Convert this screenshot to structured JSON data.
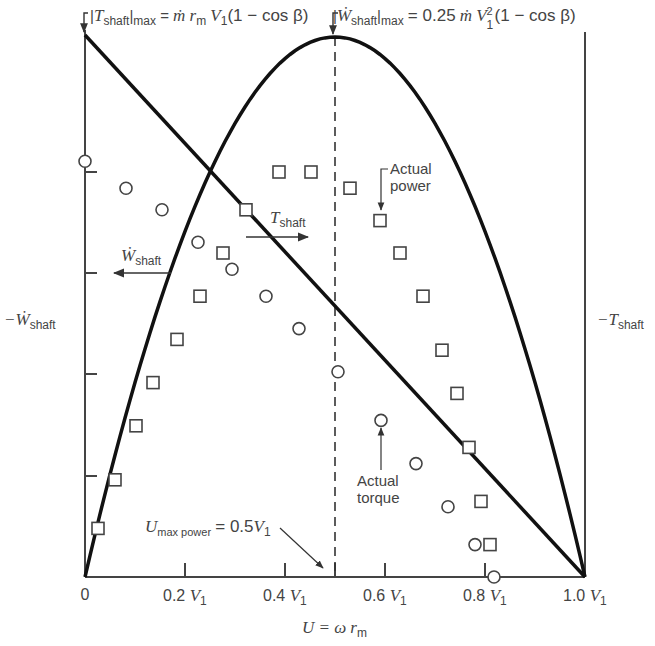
{
  "chart_data": {
    "type": "line",
    "title": "",
    "xlabel": "U = ω r_m",
    "ylabel_left": "−Ẇ_shaft",
    "ylabel_right": "−T_shaft",
    "xlim": [
      0,
      1.0
    ],
    "ylim": [
      0,
      1.0
    ],
    "x_ticks": [
      0,
      0.2,
      0.4,
      0.6,
      0.8,
      1.0
    ],
    "x_tick_labels": [
      "0",
      "0.2 V1",
      "0.4 V1",
      "0.6 V1",
      "0.8 V1",
      "1.0 V1"
    ],
    "y_ticks": [
      0.2,
      0.4,
      0.6,
      0.8
    ],
    "grid": false,
    "series": [
      {
        "name": "T_shaft (ideal torque)",
        "kind": "line",
        "x": [
          0,
          1.0
        ],
        "y": [
          1.0,
          0.0
        ]
      },
      {
        "name": "W_shaft (ideal power)",
        "kind": "curve",
        "equation": "y = 4x(1-x)",
        "x": [
          0,
          0.1,
          0.2,
          0.3,
          0.4,
          0.5,
          0.6,
          0.7,
          0.8,
          0.9,
          1.0
        ],
        "y": [
          0,
          0.36,
          0.64,
          0.84,
          0.96,
          1.0,
          0.96,
          0.84,
          0.64,
          0.36,
          0
        ]
      },
      {
        "name": "Actual power",
        "kind": "scatter",
        "marker": "square",
        "x": [
          0.026,
          0.06,
          0.102,
          0.136,
          0.184,
          0.23,
          0.276,
          0.322,
          0.388,
          0.452,
          0.53,
          0.59,
          0.63,
          0.676,
          0.714,
          0.744,
          0.768,
          0.792,
          0.81
        ],
        "y": [
          0.09,
          0.18,
          0.28,
          0.36,
          0.44,
          0.52,
          0.6,
          0.68,
          0.75,
          0.75,
          0.72,
          0.66,
          0.6,
          0.52,
          0.42,
          0.34,
          0.24,
          0.14,
          0.06
        ]
      },
      {
        "name": "Actual torque",
        "kind": "scatter",
        "marker": "circle",
        "x": [
          0.0,
          0.082,
          0.154,
          0.226,
          0.294,
          0.362,
          0.428,
          0.506,
          0.592,
          0.662,
          0.726,
          0.78,
          0.818
        ],
        "y": [
          0.77,
          0.72,
          0.68,
          0.62,
          0.57,
          0.52,
          0.46,
          0.38,
          0.29,
          0.21,
          0.13,
          0.06,
          0.0
        ]
      }
    ],
    "reference_lines": [
      {
        "type": "vertical",
        "x": 0.5,
        "style": "dashed",
        "label": "U_max power = 0.5 V1"
      }
    ],
    "annotations": [
      {
        "text": "|T_shaft|_max = ṁ r_m V1 (1 − cos β)",
        "points_to": [
          0,
          1.0
        ]
      },
      {
        "text": "|Ẇ_shaft|_max = 0.25 ṁ V1² (1 − cos β)",
        "points_to": [
          0.5,
          1.0
        ]
      },
      {
        "text": "U_max power = 0.5 V1",
        "points_to": [
          0.5,
          0
        ]
      },
      {
        "text": "T_shaft",
        "arrow": "right"
      },
      {
        "text": "Ẇ_shaft",
        "arrow": "left"
      },
      {
        "text": "Actual power",
        "points_to_marker": "square"
      },
      {
        "text": "Actual torque",
        "points_to_marker": "circle"
      }
    ]
  },
  "labels": {
    "tmax_T": "T",
    "tmax_shaft": "shaft",
    "tmax_max": "max",
    "tmax_rhs_m": "ṁ",
    "tmax_rhs_r": "r",
    "tmax_rhs_rsub": "m",
    "tmax_rhs_V": "V",
    "tmax_rhs_Vsub": "1",
    "tmax_rhs_paren": "(1 − cos β)",
    "wmax_W": "Ẇ",
    "wmax_shaft": "shaft",
    "wmax_max": "max",
    "wmax_coef": "0.25",
    "wmax_m": "ṁ",
    "wmax_V": "V",
    "wmax_sup": "2",
    "wmax_sub": "1",
    "wmax_paren": "(1 − cos β)",
    "left_axis_W": "−Ẇ",
    "left_axis_sub": "shaft",
    "right_axis_T": "−T",
    "right_axis_sub": "shaft",
    "tshaft_T": "T",
    "tshaft_sub": "shaft",
    "wshaft_W": "Ẇ",
    "wshaft_sub": "shaft",
    "actual_power_1": "Actual",
    "actual_power_2": "power",
    "actual_torque_1": "Actual",
    "actual_torque_2": "torque",
    "umax_U": "U",
    "umax_sub": "max power",
    "umax_eq": "= 0.5",
    "umax_V": "V",
    "umax_Vsub": "1",
    "xlabel_U": "U",
    "xlabel_eq": "= ω",
    "xlabel_r": "r",
    "xlabel_rsub": "m",
    "tick_0": "0",
    "tick_02": "0.2",
    "tick_04": "0.4",
    "tick_06": "0.6",
    "tick_08": "0.8",
    "tick_10": "1.0",
    "tick_V": "V",
    "tick_sub": "1"
  },
  "colors": {
    "curve": "#111111",
    "axis": "#444444",
    "marker": "#444444",
    "text": "#444444"
  }
}
